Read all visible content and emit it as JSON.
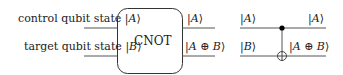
{
  "left_diagram": {
    "inputs": [
      {
        "label": "control qubit state",
        "ket": "A"
      },
      {
        "label": "target qubit state",
        "ket": "B"
      }
    ],
    "gate_label": "CNOT",
    "outputs": [
      {
        "ket": "A"
      },
      {
        "ket": "A ⊕ B"
      }
    ]
  },
  "right_diagram": {
    "inputs": [
      {
        "ket": "A"
      },
      {
        "ket": "B"
      }
    ],
    "outputs": [
      {
        "ket": "A"
      },
      {
        "ket": "A ⊕ B"
      }
    ],
    "control_symbol": "filled-dot",
    "target_symbol": "oplus"
  },
  "colors": {
    "line": "#555555",
    "text": "#222222",
    "dot": "#000000"
  }
}
